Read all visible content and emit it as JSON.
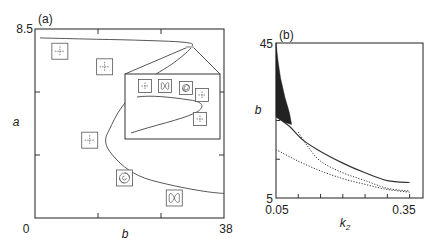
{
  "chart_data": [
    {
      "type": "line",
      "panel_label": "(a)",
      "xlabel": "b",
      "ylabel": "a",
      "xlim": [
        0,
        38
      ],
      "ylim": [
        0,
        8.5
      ],
      "x_tick_labels": [
        "0",
        "38"
      ],
      "y_tick_labels": [
        "0",
        "8.5"
      ],
      "series": [
        {
          "name": "bifurcation boundary",
          "style": "solid",
          "points": [
            [
              1,
              8.1
            ],
            [
              10,
              8.05
            ],
            [
              20,
              8.0
            ],
            [
              30,
              7.9
            ],
            [
              31.5,
              7.7
            ],
            [
              28,
              7.0
            ],
            [
              22,
              6.1
            ],
            [
              17.5,
              5.0
            ],
            [
              15,
              4.0
            ],
            [
              14.2,
              3.5
            ],
            [
              15,
              3.0
            ],
            [
              18,
              2.3
            ],
            [
              22,
              1.8
            ],
            [
              28,
              1.45
            ],
            [
              34,
              1.2
            ],
            [
              38,
              1.1
            ]
          ]
        }
      ],
      "phase_portraits": [
        {
          "type": "saddle",
          "b": 5,
          "a": 7.5
        },
        {
          "type": "saddle",
          "b": 14,
          "a": 6.8
        },
        {
          "type": "saddle",
          "b": 11,
          "a": 3.5
        },
        {
          "type": "spiral",
          "b": 18,
          "a": 1.8
        },
        {
          "type": "limit-cycle",
          "b": 28,
          "a": 0.9
        }
      ],
      "inset": {
        "zoom_of_region": "b≈31, a≈7.8",
        "phase_portraits": [
          "saddle",
          "limit-cycle",
          "spiral",
          "saddle",
          "saddle"
        ]
      }
    },
    {
      "type": "line",
      "panel_label": "(b)",
      "xlabel": "k2",
      "ylabel": "b",
      "xlim": [
        0.05,
        0.35
      ],
      "ylim": [
        5,
        45
      ],
      "x_tick_labels": [
        "0.05",
        "0.35"
      ],
      "y_tick_labels": [
        "5",
        "45"
      ],
      "series": [
        {
          "name": "solid boundary",
          "style": "solid",
          "points": [
            [
              0.05,
              26
            ],
            [
              0.08,
              23.5
            ],
            [
              0.11,
              20
            ],
            [
              0.15,
              17
            ],
            [
              0.2,
              14
            ],
            [
              0.25,
              11.5
            ],
            [
              0.3,
              9.5
            ],
            [
              0.35,
              9
            ]
          ]
        },
        {
          "name": "upper dotted",
          "style": "dotted",
          "points": [
            [
              0.1,
              22
            ],
            [
              0.12,
              18.5
            ],
            [
              0.15,
              14.5
            ],
            [
              0.2,
              11.5
            ],
            [
              0.25,
              9.5
            ],
            [
              0.3,
              7.5
            ],
            [
              0.35,
              6.8
            ]
          ]
        },
        {
          "name": "lower dotted",
          "style": "dotted",
          "points": [
            [
              0.05,
              17.5
            ],
            [
              0.1,
              14.5
            ],
            [
              0.15,
              12
            ],
            [
              0.2,
              10
            ],
            [
              0.25,
              8.5
            ],
            [
              0.3,
              7.2
            ],
            [
              0.35,
              6.5
            ]
          ]
        },
        {
          "name": "chaotic region (dense)",
          "style": "filled",
          "points": [
            [
              0.05,
              45
            ],
            [
              0.055,
              40
            ],
            [
              0.06,
              36
            ],
            [
              0.07,
              31
            ],
            [
              0.08,
              27
            ],
            [
              0.085,
              24
            ],
            [
              0.07,
              24.5
            ],
            [
              0.05,
              26
            ]
          ]
        }
      ]
    }
  ]
}
